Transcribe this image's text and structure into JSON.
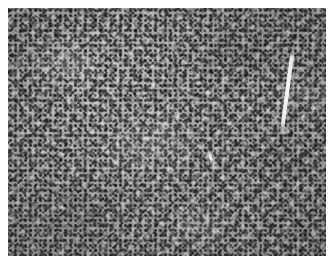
{
  "figure": {
    "kind": "photomicrograph",
    "modality": "brightfield light microscopy",
    "stain_appearance": "grayscale / monochrome reproduction",
    "tissue_description": "densely cellular sheet of small uniform round cells with hyperchromatic nuclei and scant cytoplasm",
    "magnification_visible": "none shown",
    "scale_bar_visible": "none shown",
    "caption_text": "",
    "label_text": ""
  },
  "canvas": {
    "width_px": 333,
    "height_px": 262,
    "background_color": "#ffffff",
    "margin_px": 8
  },
  "image_area": {
    "left_px": 8,
    "top_px": 8,
    "width_px": 318,
    "height_px": 248,
    "border_color": "#ffffff"
  },
  "tones": {
    "background_paper": "#ffffff",
    "tissue_midtone": "#9a9a9a",
    "tissue_light": "#c8c8c8",
    "tissue_highlight": "#ffffff",
    "nuclei_dark": "#1e1e1e",
    "nuclei_mid": "#3c3c3c",
    "shadow": "#5a5a5a"
  },
  "features": [
    {
      "name": "linear-streak-artifact",
      "description": "prominent bright white linear crack or fold artifact",
      "region": "upper right",
      "x_px": 279,
      "y_px": 42,
      "length_px": 86,
      "angle_deg": 7.5
    },
    {
      "name": "central-slit",
      "description": "small bright slit-like empty space",
      "region": "center",
      "x_px": 201,
      "y_px": 141,
      "length_px": 15,
      "angle_deg": -12
    },
    {
      "name": "vessel-ring",
      "description": "faint ring-shaped vascular profile",
      "region": "center left",
      "x_px": 148,
      "y_px": 100,
      "width_px": 22,
      "height_px": 15
    },
    {
      "name": "fibrous-bands",
      "description": "faint diagonal lighter septal bands",
      "region": "lower left to upper right",
      "angle_deg": 118
    }
  ],
  "dark_foci": [
    {
      "x_px": 44,
      "y_px": 28,
      "size_px": 5
    },
    {
      "x_px": 112,
      "y_px": 19,
      "size_px": 4
    },
    {
      "x_px": 198,
      "y_px": 36,
      "size_px": 5
    },
    {
      "x_px": 268,
      "y_px": 60,
      "size_px": 4
    },
    {
      "x_px": 31,
      "y_px": 96,
      "size_px": 5
    },
    {
      "x_px": 128,
      "y_px": 124,
      "size_px": 4
    },
    {
      "x_px": 232,
      "y_px": 118,
      "size_px": 5
    },
    {
      "x_px": 287,
      "y_px": 133,
      "size_px": 5
    },
    {
      "x_px": 67,
      "y_px": 168,
      "size_px": 4
    },
    {
      "x_px": 172,
      "y_px": 183,
      "size_px": 5
    },
    {
      "x_px": 252,
      "y_px": 196,
      "size_px": 4
    },
    {
      "x_px": 96,
      "y_px": 221,
      "size_px": 5
    },
    {
      "x_px": 205,
      "y_px": 238,
      "size_px": 4
    },
    {
      "x_px": 300,
      "y_px": 224,
      "size_px": 5
    }
  ],
  "light_clefts": [
    {
      "x_px": 36,
      "y_px": 60,
      "w_px": 3,
      "h_px": 12,
      "angle_deg": 35
    },
    {
      "x_px": 88,
      "y_px": 108,
      "w_px": 2,
      "h_px": 10,
      "angle_deg": -25
    },
    {
      "x_px": 150,
      "y_px": 62,
      "w_px": 3,
      "h_px": 9,
      "angle_deg": 60
    },
    {
      "x_px": 60,
      "y_px": 200,
      "w_px": 3,
      "h_px": 14,
      "angle_deg": 120
    },
    {
      "x_px": 242,
      "y_px": 152,
      "w_px": 2,
      "h_px": 11,
      "angle_deg": -40
    },
    {
      "x_px": 296,
      "y_px": 178,
      "w_px": 3,
      "h_px": 13,
      "angle_deg": 20
    },
    {
      "x_px": 130,
      "y_px": 230,
      "w_px": 3,
      "h_px": 10,
      "angle_deg": 70
    },
    {
      "x_px": 190,
      "y_px": 92,
      "w_px": 2,
      "h_px": 9,
      "angle_deg": -55
    }
  ]
}
